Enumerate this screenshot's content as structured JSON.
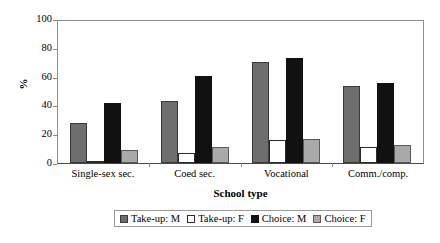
{
  "chart_data": {
    "type": "bar",
    "title": "",
    "subtitle": "",
    "xlabel": "School type",
    "ylabel": "%",
    "categories": [
      "Single-sex sec.",
      "Coed sec.",
      "Vocational",
      "Comm./comp."
    ],
    "series": [
      {
        "name": "Take-up: M",
        "color": "#6e6e6e",
        "values": [
          28,
          44,
          71,
          54
        ]
      },
      {
        "name": "Take-up: F",
        "color": "#ffffff",
        "values": [
          1,
          7,
          16,
          11
        ]
      },
      {
        "name": "Choice: M",
        "color": "#111111",
        "values": [
          42,
          61,
          74,
          56
        ]
      },
      {
        "name": "Choice: F",
        "color": "#a9a9a9",
        "values": [
          9,
          11,
          17,
          13
        ]
      }
    ],
    "ylim": [
      0,
      100
    ],
    "ytick_values": [
      0,
      20,
      40,
      60,
      80,
      100
    ],
    "ytick_labels": [
      "0",
      "20",
      "40",
      "60",
      "80",
      "100"
    ],
    "grid": false,
    "legend_position": "bottom-center",
    "legend_orientation": "horizontal"
  }
}
